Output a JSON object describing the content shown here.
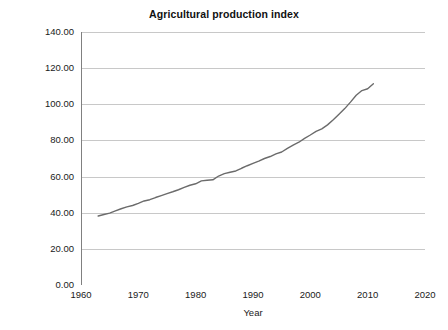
{
  "chart_data": {
    "type": "line",
    "title": "Agricultural production index",
    "xlabel": "Year",
    "ylabel": "Index of agricultural production",
    "xlim": [
      1960,
      2020
    ],
    "ylim": [
      0,
      140
    ],
    "xticks": [
      "1960",
      "1970",
      "1980",
      "1990",
      "2000",
      "2010",
      "2020"
    ],
    "xtick_values": [
      1960,
      1970,
      1980,
      1990,
      2000,
      2010,
      2020
    ],
    "yticks": [
      "0.00",
      "20.00",
      "40.00",
      "60.00",
      "80.00",
      "100.00",
      "120.00",
      "140.00"
    ],
    "ytick_values": [
      0,
      20,
      40,
      60,
      80,
      100,
      120,
      140
    ],
    "grid": "horizontal",
    "legend": "none",
    "line_color": "#6b6b6b",
    "grid_color": "#c8c8c8",
    "axis_color": "#808080",
    "background_color": "#ffffff",
    "x": [
      1963,
      1964,
      1965,
      1966,
      1967,
      1968,
      1969,
      1970,
      1971,
      1972,
      1973,
      1974,
      1975,
      1976,
      1977,
      1978,
      1979,
      1980,
      1981,
      1982,
      1983,
      1984,
      1985,
      1986,
      1987,
      1988,
      1989,
      1990,
      1991,
      1992,
      1993,
      1994,
      1995,
      1996,
      1997,
      1998,
      1999,
      2000,
      2001,
      2002,
      2003,
      2004,
      2005,
      2006,
      2007,
      2008,
      2009,
      2010,
      2011
    ],
    "values": [
      38.2,
      39.0,
      39.8,
      41.0,
      42.2,
      43.2,
      44.0,
      45.2,
      46.5,
      47.2,
      48.4,
      49.5,
      50.6,
      51.6,
      52.7,
      54.0,
      55.2,
      56.0,
      57.6,
      58.0,
      58.2,
      60.3,
      61.6,
      62.4,
      63.1,
      64.6,
      66.0,
      67.3,
      68.6,
      70.0,
      71.1,
      72.6,
      73.6,
      75.6,
      77.4,
      79.0,
      81.1,
      83.0,
      85.0,
      86.4,
      88.6,
      91.4,
      94.5,
      97.6,
      101.2,
      105.0,
      107.6,
      108.6,
      111.4
    ],
    "series_name": "Index of agricultural production",
    "annotations": []
  },
  "bottom_caption": {
    "text": ""
  }
}
